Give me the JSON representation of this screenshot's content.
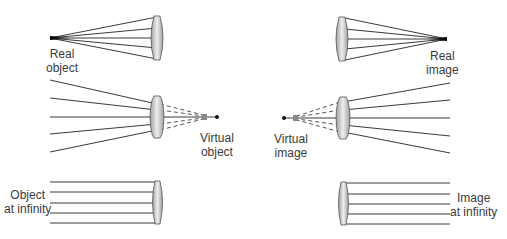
{
  "diagram": {
    "panels": [
      {
        "id": "real-object",
        "label_line1": "Real",
        "label_line2": "object"
      },
      {
        "id": "real-image",
        "label_line1": "Real",
        "label_line2": "image"
      },
      {
        "id": "virtual-object",
        "label_line1": "Virtual",
        "label_line2": "object"
      },
      {
        "id": "virtual-image",
        "label_line1": "Virtual",
        "label_line2": "image"
      },
      {
        "id": "object-at-infinity",
        "label_line1": "Object",
        "label_line2": "at infinity"
      },
      {
        "id": "image-at-infinity",
        "label_line1": "Image",
        "label_line2": "at infinity"
      }
    ],
    "colors": {
      "ray": "#3a3a3a",
      "lens_edge": "#555555",
      "lens_center": "#f0f0f0",
      "lens_edge_fill": "#a8a8a8",
      "text": "#3a3a3a"
    }
  }
}
